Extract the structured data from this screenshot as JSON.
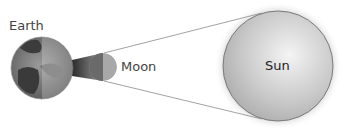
{
  "diagram": {
    "labels": {
      "earth": "Earth",
      "moon": "Moon",
      "sun": "Sun"
    },
    "colors": {
      "line": "#8a8a8a",
      "sun_fill": "#c8c8c8",
      "earth_dark": "#555555",
      "earth_light": "#9a9a9a",
      "moon_dark": "#6a6a6a",
      "moon_light": "#a8a8a8",
      "shadow": "#3a3a3a"
    }
  }
}
